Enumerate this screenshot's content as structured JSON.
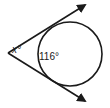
{
  "diagram": {
    "type": "geometry-tangent-secant",
    "labels": {
      "vertex_angle": "x°",
      "arc": "116°"
    },
    "colors": {
      "stroke": "#1a1a1a",
      "background": "#ffffff"
    }
  }
}
